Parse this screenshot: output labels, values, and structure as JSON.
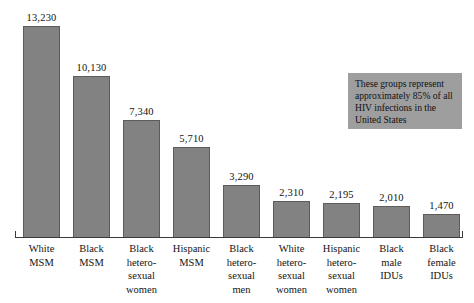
{
  "chart_data": {
    "type": "bar",
    "title": "",
    "subtitle": "",
    "xlabel": "",
    "ylabel": "",
    "ylim": [
      0,
      13230
    ],
    "grid": false,
    "legend": "none",
    "categories": [
      "White MSM",
      "Black MSM",
      "Black hetero-sexual women",
      "Hispanic MSM",
      "Black hetero-sexual men",
      "White hetero-sexual women",
      "Hispanic hetero-sexual women",
      "Black male IDUs",
      "Black female IDUs"
    ],
    "category_lines": [
      [
        "White",
        "MSM"
      ],
      [
        "Black",
        "MSM"
      ],
      [
        "Black",
        "hetero-",
        "sexual",
        "women"
      ],
      [
        "Hispanic",
        "MSM"
      ],
      [
        "Black",
        "hetero-",
        "sexual",
        "men"
      ],
      [
        "White",
        "hetero-",
        "sexual",
        "women"
      ],
      [
        "Hispanic",
        "hetero-",
        "sexual",
        "women"
      ],
      [
        "Black",
        "male",
        "IDUs"
      ],
      [
        "Black",
        "female",
        "IDUs"
      ]
    ],
    "values": [
      13230,
      10130,
      7340,
      5710,
      3290,
      2310,
      2195,
      2010,
      1470
    ],
    "value_labels": [
      "13,230",
      "10,130",
      "7,340",
      "5,710",
      "3,290",
      "2,310",
      "2,195",
      "2,010",
      "1,470"
    ],
    "annotations": [
      {
        "name": "callout",
        "lines": [
          "These groups represent",
          "approximately 85% of all",
          "HIV infections in the",
          "United States"
        ],
        "text": "These groups represent approximately 85% of all HIV infections in the United States"
      }
    ],
    "colors": {
      "bar_fill": "#828282",
      "bar_stroke": "#5c5c5c",
      "axis": "#3a3a3a",
      "text": "#141414",
      "callout_background": "#9e9e9e",
      "background": "#ffffff"
    }
  }
}
